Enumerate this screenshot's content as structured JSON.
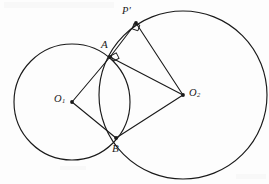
{
  "figure": {
    "background_color": "#fdfdfd",
    "stroke_color": "#1a1a1a",
    "labels": {
      "point_a": "A",
      "point_b": "B",
      "point_p_prime": "P′",
      "center_o1_base": "O",
      "center_o1_sub": "1",
      "center_o2_base": "O",
      "center_o2_sub": "2"
    },
    "points": {
      "A": {
        "x": 110,
        "y": 57,
        "name": "A"
      },
      "B": {
        "x": 116,
        "y": 138,
        "name": "B"
      },
      "P": {
        "x": 136,
        "y": 23,
        "name": "P'"
      },
      "O1": {
        "x": 72,
        "y": 102,
        "name": "O1"
      },
      "O2": {
        "x": 183,
        "y": 95,
        "name": "O2"
      }
    },
    "circles": [
      {
        "name": "circle-o1",
        "cx": 72,
        "cy": 102,
        "r": 58
      },
      {
        "name": "circle-o2",
        "cx": 183,
        "cy": 95,
        "r": 84
      }
    ],
    "segments": [
      {
        "name": "segment-o1-a",
        "x1": 72,
        "y1": 102,
        "x2": 110,
        "y2": 57
      },
      {
        "name": "segment-o1-b",
        "x1": 72,
        "y1": 102,
        "x2": 116,
        "y2": 138
      },
      {
        "name": "segment-a-o2",
        "x1": 110,
        "y1": 57,
        "x2": 183,
        "y2": 95
      },
      {
        "name": "segment-b-o2",
        "x1": 116,
        "y1": 138,
        "x2": 183,
        "y2": 95
      },
      {
        "name": "segment-a-p",
        "x1": 110,
        "y1": 57,
        "x2": 136,
        "y2": 23
      },
      {
        "name": "segment-p-o2",
        "x1": 136,
        "y1": 23,
        "x2": 183,
        "y2": 95
      }
    ],
    "right_angle_marks": [
      {
        "name": "right-angle-at-a",
        "x": 112,
        "y": 54,
        "size": 6,
        "rotation": -28
      },
      {
        "name": "right-angle-at-p",
        "x": 133,
        "y": 24,
        "size": 6,
        "rotation": 18
      }
    ]
  }
}
